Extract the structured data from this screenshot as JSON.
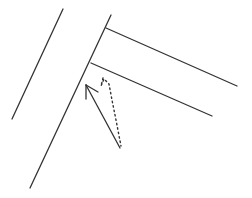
{
  "diagram": {
    "colors": {
      "background": "#ffffff",
      "stroke": "#333333"
    },
    "lines": [
      {
        "name": "left-wall-outer",
        "x1": 63,
        "y1": 9,
        "x2": 12,
        "y2": 119
      },
      {
        "name": "main-wall",
        "x1": 111,
        "y1": 15,
        "x2": 30,
        "y2": 188
      },
      {
        "name": "corridor-top",
        "x1": 106,
        "y1": 28,
        "x2": 237,
        "y2": 86
      },
      {
        "name": "corridor-bottom",
        "x1": 91,
        "y1": 63,
        "x2": 212,
        "y2": 116
      }
    ],
    "arrow": {
      "name": "solid-arrow",
      "x1": 120,
      "y1": 148,
      "x2": 86,
      "y2": 85
    },
    "dotted_trail": {
      "name": "dotted-trail",
      "points": [
        [
          104,
          79
        ],
        [
          106,
          85
        ],
        [
          110,
          100
        ],
        [
          115,
          120
        ],
        [
          121,
          146
        ]
      ]
    }
  }
}
